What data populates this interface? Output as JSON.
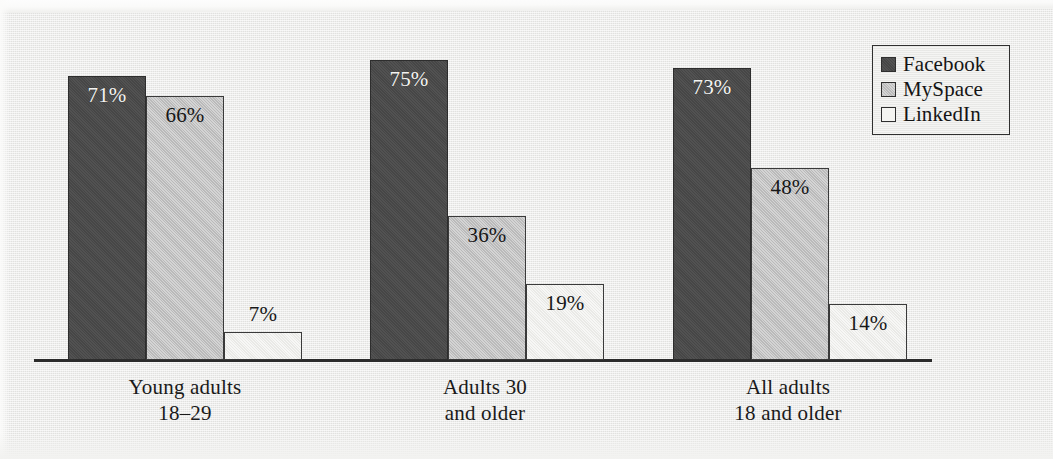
{
  "chart_data": {
    "type": "bar",
    "title": "",
    "subtitle": "",
    "xlabel": "",
    "ylabel": "",
    "ylim": [
      0,
      80
    ],
    "grid": false,
    "legend_position": "top-right",
    "orientation": "vertical",
    "grouping": "clustered",
    "value_suffix": "%",
    "categories": [
      "Young adults\n18–29",
      "Adults 30\nand older",
      "All adults\n18 and older"
    ],
    "series": [
      {
        "name": "Facebook",
        "color": "#4a4a4a",
        "values": [
          71,
          66,
          7
        ]
      },
      {
        "name": "MySpace",
        "color": "#c2c2c2",
        "values": [
          75,
          36,
          19
        ]
      },
      {
        "name": "LinkedIn",
        "color": "#efefec",
        "values": [
          73,
          48,
          14
        ]
      }
    ],
    "groups": [
      {
        "category_line1": "Young adults",
        "category_line2": "18–29",
        "bars": [
          {
            "series": "Facebook",
            "value": 71,
            "label": "71%",
            "label_placement": "inside",
            "label_color": "light"
          },
          {
            "series": "MySpace",
            "value": 66,
            "label": "66%",
            "label_placement": "inside",
            "label_color": "dark"
          },
          {
            "series": "LinkedIn",
            "value": 7,
            "label": "7%",
            "label_placement": "above",
            "label_color": "dark"
          }
        ]
      },
      {
        "category_line1": "Adults 30",
        "category_line2": "and older",
        "bars": [
          {
            "series": "Facebook",
            "value": 75,
            "label": "75%",
            "label_placement": "inside",
            "label_color": "light"
          },
          {
            "series": "MySpace",
            "value": 36,
            "label": "36%",
            "label_placement": "inside",
            "label_color": "dark"
          },
          {
            "series": "LinkedIn",
            "value": 19,
            "label": "19%",
            "label_placement": "inside",
            "label_color": "dark"
          }
        ]
      },
      {
        "category_line1": "All adults",
        "category_line2": "18 and older",
        "bars": [
          {
            "series": "Facebook",
            "value": 73,
            "label": "73%",
            "label_placement": "inside",
            "label_color": "light"
          },
          {
            "series": "MySpace",
            "value": 48,
            "label": "48%",
            "label_placement": "inside",
            "label_color": "dark"
          },
          {
            "series": "LinkedIn",
            "value": 14,
            "label": "14%",
            "label_placement": "inside",
            "label_color": "dark"
          }
        ]
      }
    ]
  },
  "legend": {
    "items": [
      {
        "label": "Facebook",
        "swatch": "legend-swatch-facebook"
      },
      {
        "label": "MySpace",
        "swatch": "legend-swatch-myspace"
      },
      {
        "label": "LinkedIn",
        "swatch": "legend-swatch-linkedin"
      }
    ]
  },
  "axis": {
    "baseline_visible": true
  },
  "palette": {
    "facebook": "#4a4a4a",
    "myspace": "#c2c2c2",
    "linkedin": "#efefec",
    "ink": "#1a1a1a",
    "paper": "#e9e9e7"
  }
}
